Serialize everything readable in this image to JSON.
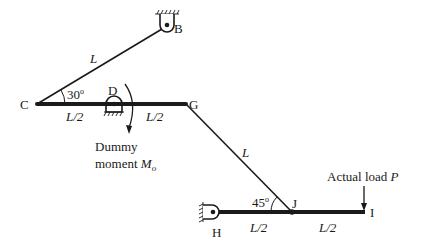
{
  "diagram": {
    "nodes": {
      "B": {
        "label": "B",
        "type": "pin-support"
      },
      "C": {
        "label": "C",
        "type": "joint"
      },
      "D": {
        "label": "D",
        "type": "pin-support"
      },
      "G": {
        "label": "G",
        "type": "joint"
      },
      "H": {
        "label": "H",
        "type": "pin-support"
      },
      "I": {
        "label": "I",
        "type": "free-end"
      },
      "J": {
        "label": "J",
        "type": "joint"
      }
    },
    "members": {
      "CB": {
        "length_label": "L"
      },
      "CD": {
        "length_label": "L/2"
      },
      "DG": {
        "length_label": "L/2"
      },
      "GJ": {
        "length_label": "L"
      },
      "HJ": {
        "length_label": "L/2"
      },
      "JI": {
        "length_label": "L/2"
      }
    },
    "angles": {
      "C": {
        "label": "30",
        "degree": "o"
      },
      "J": {
        "label": "45",
        "degree": "o"
      }
    },
    "dummy_moment": {
      "line1": "Dummy",
      "line2_prefix": "moment ",
      "symbol": "M",
      "subscript": "o"
    },
    "actual_load": {
      "prefix": "Actual load ",
      "symbol": "P"
    }
  }
}
